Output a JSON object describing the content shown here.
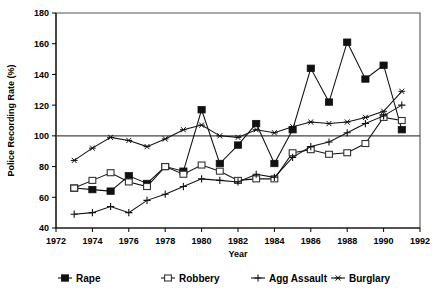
{
  "chart_data": {
    "type": "line",
    "title": "",
    "xlabel": "Year",
    "ylabel": "Police Recording Rate (%)",
    "xlim": [
      1972,
      1992
    ],
    "ylim": [
      40,
      180
    ],
    "xticks": [
      1972,
      1974,
      1976,
      1978,
      1980,
      1982,
      1984,
      1986,
      1988,
      1990,
      1992
    ],
    "yticks": [
      40,
      60,
      80,
      100,
      120,
      140,
      160,
      180
    ],
    "grid": false,
    "reference_line": 100,
    "legend_position": "bottom",
    "x": [
      1973,
      1974,
      1975,
      1976,
      1977,
      1978,
      1979,
      1980,
      1981,
      1982,
      1983,
      1984,
      1985,
      1986,
      1987,
      1988,
      1989,
      1990,
      1991
    ],
    "series": [
      {
        "name": "Rape",
        "marker": "filled-square",
        "values": [
          66,
          65,
          64,
          74,
          69,
          80,
          77,
          117,
          82,
          94,
          108,
          82,
          104,
          144,
          122,
          161,
          137,
          146,
          104
        ]
      },
      {
        "name": "Robbery",
        "marker": "open-square",
        "values": [
          66,
          71,
          76,
          70,
          67,
          80,
          75,
          81,
          77,
          71,
          72,
          72,
          89,
          91,
          88,
          89,
          95,
          112,
          110
        ]
      },
      {
        "name": "Agg Assault",
        "marker": "plus",
        "values": [
          49,
          50,
          54,
          50,
          58,
          62,
          67,
          72,
          71,
          70,
          75,
          73,
          86,
          93,
          96,
          102,
          108,
          113,
          120
        ]
      },
      {
        "name": "Burglary",
        "marker": "star",
        "values": [
          84,
          92,
          99,
          97,
          93,
          98,
          104,
          107,
          100,
          99,
          104,
          102,
          106,
          109,
          108,
          109,
          112,
          116,
          129
        ]
      }
    ]
  },
  "axes": {
    "x_tick_labels": [
      "1972",
      "1974",
      "1976",
      "1978",
      "1980",
      "1982",
      "1984",
      "1986",
      "1988",
      "1990",
      "1992"
    ],
    "y_tick_labels": [
      "40",
      "60",
      "80",
      "100",
      "120",
      "140",
      "160",
      "180"
    ],
    "x_title": "Year",
    "y_title": "Police Recording Rate (%)"
  },
  "legend": {
    "items": [
      {
        "label": "Rape",
        "marker": "filled-square"
      },
      {
        "label": "Robbery",
        "marker": "open-square"
      },
      {
        "label": "Agg Assault",
        "marker": "plus"
      },
      {
        "label": "Burglary",
        "marker": "star"
      }
    ]
  },
  "colors": {
    "ink": "#111111",
    "frame": "#555555",
    "background": "#ffffff"
  }
}
